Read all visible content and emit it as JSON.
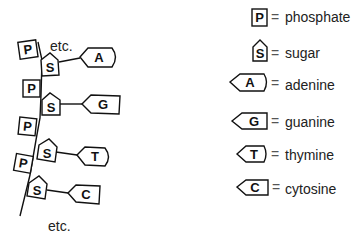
{
  "diagram": {
    "strand": {
      "top_label": "etc.",
      "bottom_label": "etc.",
      "nucleotides": [
        {
          "phosphate": "P",
          "sugar": "S",
          "base": "A",
          "base_shape": "rounded-end"
        },
        {
          "phosphate": "P",
          "sugar": "S",
          "base": "G",
          "base_shape": "square-end"
        },
        {
          "phosphate": "P",
          "sugar": "S",
          "base": "T",
          "base_shape": "rounded-end"
        },
        {
          "phosphate": "P",
          "sugar": "S",
          "base": "C",
          "base_shape": "square-end"
        }
      ]
    },
    "legend": [
      {
        "symbol": "P",
        "shape": "square",
        "equals": "=",
        "meaning": "phosphate"
      },
      {
        "symbol": "S",
        "shape": "pentagon",
        "equals": "=",
        "meaning": "sugar"
      },
      {
        "symbol": "A",
        "shape": "arrow-rounded",
        "equals": "=",
        "meaning": "adenine"
      },
      {
        "symbol": "G",
        "shape": "arrow-square",
        "equals": "=",
        "meaning": "guanine"
      },
      {
        "symbol": "T",
        "shape": "arrow-rounded",
        "equals": "=",
        "meaning": "thymine"
      },
      {
        "symbol": "C",
        "shape": "arrow-square",
        "equals": "=",
        "meaning": "cytosine"
      }
    ]
  }
}
